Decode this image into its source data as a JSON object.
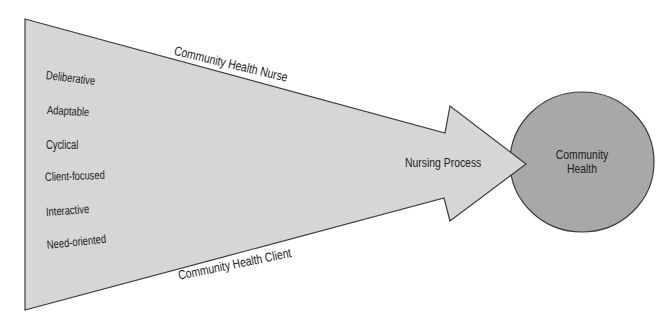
{
  "colors": {
    "background": "#ffffff",
    "arrow_fill": "#d6d6d6",
    "circle_fill": "#a8a8a8",
    "outline": "#3d3d3d",
    "text": "#222222"
  },
  "arrow": {
    "top_edge_label": "Community Health Nurse",
    "bottom_edge_label": "Community Health Client",
    "funnel_labels": [
      "Deliberative",
      "Adaptable",
      "Cyclical",
      "Client-focused",
      "Interactive",
      "Need-oriented"
    ],
    "process_label": "Nursing Process"
  },
  "circle": {
    "label_line1": "Community",
    "label_line2": "Health"
  }
}
